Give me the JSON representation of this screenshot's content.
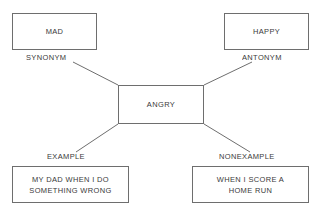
{
  "diagram": {
    "line_color": "#6e6e6e",
    "text_color": "#3a3a3a",
    "background": "#ffffff",
    "center": {
      "id": "angry",
      "text": "ANGRY"
    },
    "nodes": [
      {
        "id": "mad",
        "position": "top-left",
        "text": "MAD",
        "label": "SYNONYM"
      },
      {
        "id": "happy",
        "position": "top-right",
        "text": "HAPPY",
        "label": "ANTONYM"
      },
      {
        "id": "example",
        "position": "bottom-left",
        "text": "MY DAD WHEN I DO\nSOMETHING WRONG",
        "label": "EXAMPLE"
      },
      {
        "id": "nonexample",
        "position": "bottom-right",
        "text": "WHEN I SCORE A\nHOME RUN",
        "label": "NONEXAMPLE"
      }
    ],
    "connectors": [
      {
        "id": "connector-synonym",
        "from": "angry-top-left",
        "x1": 118,
        "y1": 85,
        "x2": 73,
        "y2": 62
      },
      {
        "id": "connector-antonym",
        "from": "angry-top-right",
        "x1": 204,
        "y1": 85,
        "x2": 252,
        "y2": 62
      },
      {
        "id": "connector-example",
        "from": "angry-bottom-left",
        "x1": 118,
        "y1": 124,
        "x2": 76,
        "y2": 152
      },
      {
        "id": "connector-nonexample",
        "from": "angry-bottom-right",
        "x1": 204,
        "y1": 124,
        "x2": 250,
        "y2": 152
      }
    ]
  }
}
